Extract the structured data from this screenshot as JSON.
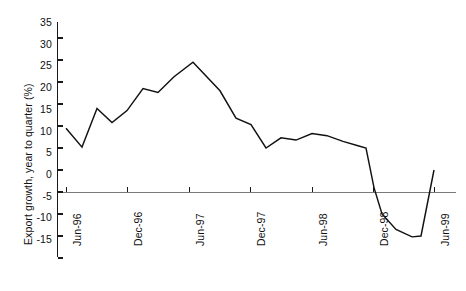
{
  "chart_data": {
    "type": "line",
    "title": "",
    "xlabel": "",
    "ylabel": "Export growth, year to quarter (%)",
    "ylim": [
      -15,
      35
    ],
    "yticks": [
      35,
      30,
      25,
      20,
      15,
      10,
      5,
      0,
      -5,
      -10,
      -15
    ],
    "ytick_labels": [
      "35",
      "30",
      "25",
      "20",
      "15",
      "10",
      "5",
      "0",
      "-5",
      "-10",
      "-15"
    ],
    "xtick_labels": [
      "Jun-96",
      "Dec-96",
      "Jun-97",
      "Dec-97",
      "Jun-98",
      "Dec-98",
      "Jun-99"
    ],
    "grid": false,
    "legend": false,
    "zero_line": true,
    "x": [
      "Jun-96",
      "Sep-96",
      "Dec-96",
      "Mar-97",
      "Jun-97",
      "Sep-97",
      "Dec-97",
      "Mar-98",
      "Jun-98",
      "Sep-98",
      "Dec-98",
      "Mar-99",
      "Jun-99",
      "Sep-99",
      "Dec-99",
      "Mar-00",
      "Jun-00"
    ],
    "values": [
      14.5,
      10.2,
      19.0,
      15.8,
      18.5,
      23.5,
      22.6,
      26.2,
      29.5,
      25.5,
      16.8,
      15.3,
      6.5,
      9.0,
      8.2,
      10.0,
      9.5
    ],
    "series": [
      {
        "name": "Export growth, year to quarter (%)",
        "points": [
          {
            "x": 66,
            "value": 14.5
          },
          {
            "x": 82,
            "value": 10.2
          },
          {
            "x": 97,
            "value": 19.0
          },
          {
            "x": 112,
            "value": 15.8
          },
          {
            "x": 127,
            "value": 18.5
          },
          {
            "x": 143,
            "value": 23.5
          },
          {
            "x": 158,
            "value": 22.6
          },
          {
            "x": 174,
            "value": 26.2
          },
          {
            "x": 193,
            "value": 29.5
          },
          {
            "x": 220,
            "value": 23.0
          },
          {
            "x": 236,
            "value": 16.8
          },
          {
            "x": 251,
            "value": 15.3
          },
          {
            "x": 266,
            "value": 10.0
          },
          {
            "x": 281,
            "value": 12.3
          },
          {
            "x": 296,
            "value": 11.8
          },
          {
            "x": 312,
            "value": 13.3
          },
          {
            "x": 327,
            "value": 12.8
          },
          {
            "x": 343,
            "value": 11.5
          },
          {
            "x": 358,
            "value": 10.5
          },
          {
            "x": 366,
            "value": 10.0
          },
          {
            "x": 374,
            "value": 1.0
          },
          {
            "x": 382,
            "value": -5.0
          },
          {
            "x": 396,
            "value": -8.5
          },
          {
            "x": 412,
            "value": -10.2
          },
          {
            "x": 421,
            "value": -10.0
          },
          {
            "x": 434,
            "value": 5.0
          }
        ]
      }
    ],
    "annotations": [],
    "axis_color": "#111111",
    "line_color": "#111111",
    "background_color": "#ffffff"
  },
  "ytick_positions": [
    22,
    44,
    65,
    87,
    108,
    130,
    171,
    192,
    214,
    236,
    257
  ],
  "xtick_positions": [
    66,
    127,
    189,
    250,
    312,
    373,
    434
  ]
}
